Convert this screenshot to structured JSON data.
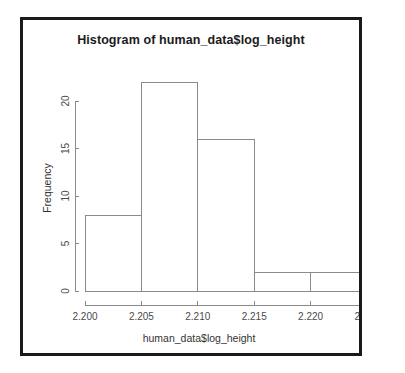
{
  "figure": {
    "title": "Histogram of human_data$log_height",
    "background_color": "#ffffff",
    "frame_color": "#1a1a1a",
    "bar_stroke_color": "#8a8a8a",
    "bar_fill_color": "#ffffff",
    "axis_color": "#8a8a8a"
  },
  "axes": {
    "x_title": "human_data$log_height",
    "y_title": "Frequency",
    "x_tick_labels": [
      "2.200",
      "2.205",
      "2.210",
      "2.215",
      "2.220",
      "2.225"
    ],
    "y_tick_labels": [
      "0",
      "5",
      "10",
      "15",
      "20"
    ]
  },
  "chart_data": {
    "type": "bar",
    "title": "Histogram of human_data$log_height",
    "xlabel": "human_data$log_height",
    "ylabel": "Frequency",
    "xlim": [
      2.2,
      2.225
    ],
    "ylim": [
      0,
      22
    ],
    "grid": false,
    "legend": false,
    "bin_width": 0.005,
    "bin_edges": [
      2.2,
      2.205,
      2.21,
      2.215,
      2.22,
      2.225
    ],
    "categories": [
      "2.200-2.205",
      "2.205-2.210",
      "2.210-2.215",
      "2.215-2.220",
      "2.220-2.225"
    ],
    "values": [
      8,
      22,
      16,
      2,
      2
    ],
    "x_ticks": [
      2.2,
      2.205,
      2.21,
      2.215,
      2.22,
      2.225
    ],
    "y_ticks": [
      0,
      5,
      10,
      15,
      20
    ],
    "x_tick_labels": [
      "2.200",
      "2.205",
      "2.210",
      "2.215",
      "2.220",
      "2.225"
    ],
    "y_tick_labels": [
      "0",
      "5",
      "10",
      "15",
      "20"
    ],
    "total_count": 50
  }
}
